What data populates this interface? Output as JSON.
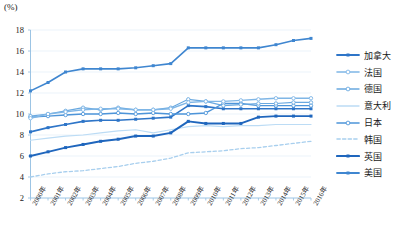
{
  "axis_unit": "(%)",
  "legend": {
    "items": [
      {
        "label": "加拿大",
        "color": "#2e75c8",
        "style": "solid-square",
        "width": 1.6
      },
      {
        "label": "法国",
        "color": "#7fb6e6",
        "style": "solid-circle",
        "width": 1.4
      },
      {
        "label": "德国",
        "color": "#6aa9e0",
        "style": "solid-circle",
        "width": 1.2
      },
      {
        "label": "意大利",
        "color": "#bcdcf5",
        "style": "plain",
        "width": 1.2
      },
      {
        "label": "日本",
        "color": "#4e95d9",
        "style": "solid-circle",
        "width": 1.4
      },
      {
        "label": "韩国",
        "color": "#a8cfee",
        "style": "dashed",
        "width": 1.3
      },
      {
        "label": "英国",
        "color": "#1f66bd",
        "style": "solid-square",
        "width": 1.9
      },
      {
        "label": "美国",
        "color": "#3f86d0",
        "style": "solid-square",
        "width": 1.6
      }
    ]
  },
  "chart_data": {
    "type": "line",
    "title": "",
    "xlabel": "",
    "ylabel": "(%)",
    "ylim": [
      2,
      18
    ],
    "ytick_step": 2,
    "yticks": [
      2,
      4,
      6,
      8,
      10,
      12,
      14,
      16,
      18
    ],
    "grid": true,
    "legend_position": "right",
    "categories": [
      "2000年",
      "2001年",
      "2002年",
      "2003年",
      "2004年",
      "2005年",
      "2006年",
      "2007年",
      "2008年",
      "2009年",
      "2010年",
      "2011年",
      "2012年",
      "2013年",
      "2014年",
      "2015年",
      "2016年"
    ],
    "x": [
      2000,
      2001,
      2002,
      2003,
      2004,
      2005,
      2006,
      2007,
      2008,
      2009,
      2010,
      2011,
      2012,
      2013,
      2014,
      2015,
      2016
    ],
    "series": [
      {
        "name": "美国",
        "color": "#3f86d0",
        "values": [
          12.2,
          13.0,
          14.0,
          14.3,
          14.3,
          14.3,
          14.4,
          14.6,
          14.8,
          16.3,
          16.3,
          16.3,
          16.3,
          16.3,
          16.6,
          17.0,
          17.2
        ]
      },
      {
        "name": "法国",
        "color": "#7fb6e6",
        "values": [
          9.6,
          10.0,
          10.2,
          10.4,
          10.5,
          10.5,
          10.4,
          10.4,
          10.5,
          11.1,
          11.2,
          11.2,
          11.3,
          11.4,
          11.5,
          11.5,
          11.5
        ]
      },
      {
        "name": "德国",
        "color": "#6aa9e0",
        "values": [
          9.8,
          10.0,
          10.3,
          10.6,
          10.4,
          10.6,
          10.4,
          10.4,
          10.6,
          11.4,
          11.2,
          10.8,
          10.9,
          11.0,
          11.0,
          11.1,
          11.1
        ]
      },
      {
        "name": "日本",
        "color": "#4e95d9",
        "values": [
          9.7,
          9.8,
          9.9,
          10.0,
          10.0,
          10.1,
          10.0,
          10.1,
          10.0,
          10.0,
          10.1,
          11.0,
          11.0,
          10.8,
          10.8,
          10.8,
          10.8
        ]
      },
      {
        "name": "加拿大",
        "color": "#2e75c8",
        "values": [
          8.3,
          8.7,
          9.0,
          9.3,
          9.4,
          9.4,
          9.5,
          9.6,
          9.7,
          10.8,
          10.7,
          10.5,
          10.5,
          10.5,
          10.5,
          10.5,
          10.5
        ]
      },
      {
        "name": "意大利",
        "color": "#bcdcf5",
        "values": [
          7.5,
          7.7,
          7.9,
          8.0,
          8.2,
          8.4,
          8.5,
          8.2,
          8.5,
          8.8,
          8.9,
          8.8,
          8.9,
          8.9,
          9.0,
          9.0,
          9.0
        ]
      },
      {
        "name": "英国",
        "color": "#1f66bd",
        "values": [
          6.0,
          6.4,
          6.8,
          7.1,
          7.4,
          7.6,
          7.9,
          7.9,
          8.2,
          9.3,
          9.1,
          9.1,
          9.1,
          9.7,
          9.8,
          9.8,
          9.8
        ]
      },
      {
        "name": "韩国",
        "color": "#a8cfee",
        "values": [
          4.0,
          4.3,
          4.5,
          4.6,
          4.8,
          5.0,
          5.3,
          5.5,
          5.8,
          6.3,
          6.4,
          6.5,
          6.7,
          6.8,
          7.0,
          7.2,
          7.4
        ]
      }
    ]
  }
}
